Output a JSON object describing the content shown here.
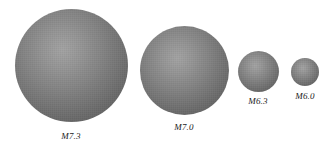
{
  "figure": {
    "type": "scientific-figure",
    "background_color": "#ffffff",
    "label_color": "#1a1a1a",
    "sphere_rim_color": "#545454",
    "sphere_highlight_color": "#a3a3a3"
  },
  "chart_data": {
    "type": "scatter",
    "title": "",
    "xlabel": "",
    "ylabel": "",
    "categories": [
      "M7.3",
      "M7.0",
      "M6.3",
      "M6.0"
    ],
    "values": [
      7.3,
      7.0,
      6.3,
      6.0
    ],
    "marker_diameters_px": [
      113,
      89,
      41,
      28
    ],
    "legend_position": "none",
    "grid": false
  },
  "spheres": [
    {
      "label": "M7.3",
      "magnitude": 7.3,
      "diameter": 113,
      "center_x": 71,
      "center_y": 65,
      "label_x": 71,
      "label_y": 131
    },
    {
      "label": "M7.0",
      "magnitude": 7.0,
      "diameter": 89,
      "center_x": 184,
      "center_y": 70,
      "label_x": 184,
      "label_y": 122
    },
    {
      "label": "M6.3",
      "magnitude": 6.3,
      "diameter": 41,
      "center_x": 258,
      "center_y": 71,
      "label_x": 258,
      "label_y": 96
    },
    {
      "label": "M6.0",
      "magnitude": 6.0,
      "diameter": 28,
      "center_x": 305,
      "center_y": 72,
      "label_x": 305,
      "label_y": 91
    }
  ]
}
